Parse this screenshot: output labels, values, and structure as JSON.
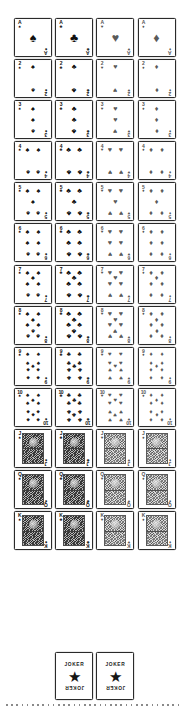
{
  "sheet": {
    "title": "Playing Card Deck Sheet",
    "background_color": "#ffffff",
    "ink_color": "#111111",
    "red_suit_render_color": "#5a5a5a",
    "columns": 4,
    "rows": 13,
    "total_cards": 54
  },
  "suits": [
    {
      "key": "spades",
      "name": "Spades",
      "glyph": "♠",
      "color": "black"
    },
    {
      "key": "clubs",
      "name": "Clubs",
      "glyph": "♣",
      "color": "black"
    },
    {
      "key": "hearts",
      "name": "Hearts",
      "glyph": "♥",
      "color": "red"
    },
    {
      "key": "diamonds",
      "name": "Diamonds",
      "glyph": "♦",
      "color": "red"
    }
  ],
  "ranks": [
    {
      "key": "A",
      "label": "A",
      "value": 1,
      "type": "ace"
    },
    {
      "key": "2",
      "label": "2",
      "value": 2,
      "type": "pip"
    },
    {
      "key": "3",
      "label": "3",
      "value": 3,
      "type": "pip"
    },
    {
      "key": "4",
      "label": "4",
      "value": 4,
      "type": "pip"
    },
    {
      "key": "5",
      "label": "5",
      "value": 5,
      "type": "pip"
    },
    {
      "key": "6",
      "label": "6",
      "value": 6,
      "type": "pip"
    },
    {
      "key": "7",
      "label": "7",
      "value": 7,
      "type": "pip"
    },
    {
      "key": "8",
      "label": "8",
      "value": 8,
      "type": "pip"
    },
    {
      "key": "9",
      "label": "9",
      "value": 9,
      "type": "pip"
    },
    {
      "key": "10",
      "label": "10",
      "value": 10,
      "type": "pip"
    },
    {
      "key": "J",
      "label": "J",
      "value": 11,
      "type": "court"
    },
    {
      "key": "Q",
      "label": "Q",
      "value": 12,
      "type": "court"
    },
    {
      "key": "K",
      "label": "K",
      "value": 13,
      "type": "court"
    }
  ],
  "pip_layouts": {
    "A": [
      [
        50,
        50
      ]
    ],
    "2": [
      [
        50,
        14
      ],
      [
        50,
        86
      ]
    ],
    "3": [
      [
        50,
        14
      ],
      [
        50,
        50
      ],
      [
        50,
        86
      ]
    ],
    "4": [
      [
        24,
        14
      ],
      [
        76,
        14
      ],
      [
        24,
        86
      ],
      [
        76,
        86
      ]
    ],
    "5": [
      [
        24,
        14
      ],
      [
        76,
        14
      ],
      [
        50,
        50
      ],
      [
        24,
        86
      ],
      [
        76,
        86
      ]
    ],
    "6": [
      [
        24,
        14
      ],
      [
        76,
        14
      ],
      [
        24,
        50
      ],
      [
        76,
        50
      ],
      [
        24,
        86
      ],
      [
        76,
        86
      ]
    ],
    "7": [
      [
        24,
        14
      ],
      [
        76,
        14
      ],
      [
        50,
        32
      ],
      [
        24,
        50
      ],
      [
        76,
        50
      ],
      [
        24,
        86
      ],
      [
        76,
        86
      ]
    ],
    "8": [
      [
        24,
        14
      ],
      [
        76,
        14
      ],
      [
        50,
        32
      ],
      [
        24,
        50
      ],
      [
        76,
        50
      ],
      [
        50,
        68
      ],
      [
        24,
        86
      ],
      [
        76,
        86
      ]
    ],
    "9": [
      [
        24,
        12
      ],
      [
        76,
        12
      ],
      [
        24,
        38
      ],
      [
        76,
        38
      ],
      [
        50,
        50
      ],
      [
        24,
        62
      ],
      [
        76,
        62
      ],
      [
        24,
        88
      ],
      [
        76,
        88
      ]
    ],
    "10": [
      [
        24,
        10
      ],
      [
        76,
        10
      ],
      [
        50,
        25
      ],
      [
        24,
        36
      ],
      [
        76,
        36
      ],
      [
        24,
        64
      ],
      [
        76,
        64
      ],
      [
        50,
        75
      ],
      [
        24,
        90
      ],
      [
        76,
        90
      ]
    ]
  },
  "jokers": [
    {
      "name": "Joker",
      "word_top": "JOKER",
      "word_bottom": "JOKER",
      "emblem": "star",
      "emblem_glyph": "★"
    },
    {
      "name": "Joker",
      "word_top": "JOKER",
      "word_bottom": "JOKER",
      "emblem": "star",
      "emblem_glyph": "★"
    }
  ],
  "footer": {
    "rule_style": "dotted",
    "rule_color": "#8a8a8a"
  }
}
